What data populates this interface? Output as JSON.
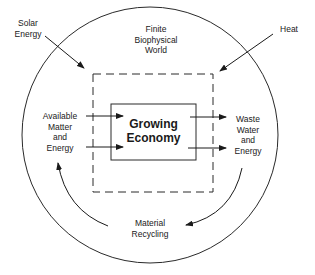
{
  "diagram": {
    "outer_circle_label": [
      "Finite",
      "Biophysical",
      "World"
    ],
    "center_box_label": [
      "Growing",
      "Economy"
    ],
    "inputs": {
      "solar": [
        "Solar",
        "Energy"
      ],
      "available": [
        "Available",
        "Matter",
        "and",
        "Energy"
      ]
    },
    "outputs": {
      "heat": [
        "Heat"
      ],
      "waste": [
        "Waste",
        "Water",
        "and",
        "Energy"
      ]
    },
    "loop": [
      "Material",
      "Recycling"
    ]
  },
  "colors": {
    "line": "#2a2a2a",
    "background": "#ffffff"
  }
}
